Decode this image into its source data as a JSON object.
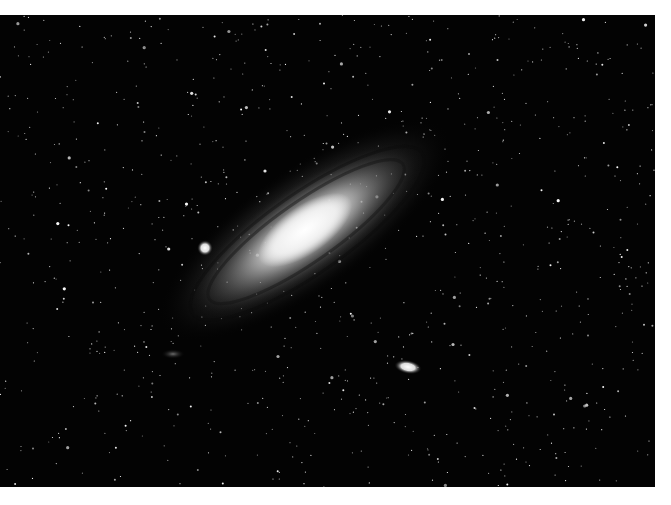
{
  "image": {
    "subject": "Andromeda galaxy (M31) with satellite galaxies M32 and M110",
    "background_color": "#ffffff",
    "sky_color": "#030303",
    "frame": {
      "x": 0,
      "y": 15,
      "width": 655,
      "height": 472
    }
  },
  "objects": {
    "galaxy": {
      "cx": 305,
      "cy": 230,
      "rx": 150,
      "ry": 48,
      "rotation": -35
    },
    "satellite_compact": {
      "cx": 205,
      "cy": 233,
      "r": 6
    },
    "satellite_elliptical": {
      "cx": 408,
      "cy": 352,
      "rx": 13,
      "ry": 6,
      "rotation": 10
    },
    "faint_cluster": {
      "cx": 173,
      "cy": 338
    }
  },
  "starfield": {
    "count": 900,
    "seed": 42
  }
}
